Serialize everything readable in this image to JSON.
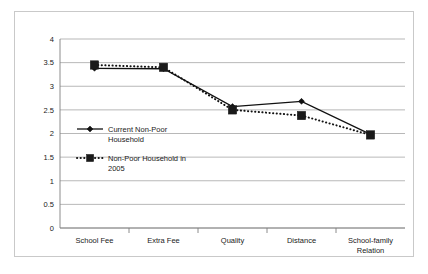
{
  "chart_data": {
    "type": "line",
    "title": "",
    "xlabel": "",
    "ylabel": "",
    "ylim": [
      0,
      4
    ],
    "ytick_step": 0.5,
    "grid": true,
    "legend_position": "inside-left",
    "categories": [
      "School Fee",
      "Extra Fee",
      "Quality",
      "Distance",
      "School-family Relation"
    ],
    "category_lines": [
      [
        "School Fee"
      ],
      [
        "Extra Fee"
      ],
      [
        "Quality"
      ],
      [
        "Distance"
      ],
      [
        "School-family",
        "Relation"
      ]
    ],
    "ytick_labels": [
      "0",
      "0.5",
      "1",
      "1.5",
      "2",
      "2.5",
      "3",
      "3.5",
      "4"
    ],
    "ytick_values": [
      0,
      0.5,
      1,
      1.5,
      2,
      2.5,
      3,
      3.5,
      4
    ],
    "series": [
      {
        "name": "Current Non-Poor Household",
        "legend_lines": [
          "Current Non-Poor",
          "Household"
        ],
        "style": "solid",
        "marker": "diamond",
        "color": "#111111",
        "values": [
          3.38,
          3.37,
          2.57,
          2.68,
          1.98
        ]
      },
      {
        "name": "Non-Poor Household in 2005",
        "legend_lines": [
          "Non-Poor Household in",
          "2005"
        ],
        "style": "dotted",
        "marker": "square",
        "color": "#1a1a1a",
        "values": [
          3.45,
          3.4,
          2.5,
          2.38,
          1.97
        ]
      }
    ]
  },
  "frame": {
    "border_color": "#c9c9c9",
    "background": "#ffffff"
  }
}
